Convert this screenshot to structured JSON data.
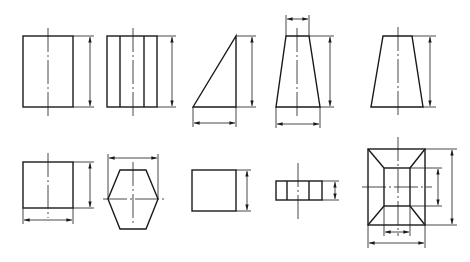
{
  "diagram": {
    "title": "",
    "line_color": "#1a1a1a",
    "background": "#ffffff",
    "figures": [
      {
        "id": 1,
        "name": "rectangle-view",
        "row": 1,
        "dimensions": [
          "height"
        ]
      },
      {
        "id": 2,
        "name": "multi-face-prism-view",
        "row": 1,
        "dimensions": [
          "height"
        ]
      },
      {
        "id": 3,
        "name": "right-triangle-view",
        "row": 1,
        "dimensions": [
          "height",
          "width"
        ]
      },
      {
        "id": 4,
        "name": "trapezoid-view-dimensioned",
        "row": 1,
        "dimensions": [
          "top-width",
          "height",
          "bottom-width"
        ]
      },
      {
        "id": 5,
        "name": "trapezoid-view",
        "row": 1,
        "dimensions": [
          "height"
        ]
      },
      {
        "id": 6,
        "name": "square-view",
        "row": 2,
        "dimensions": [
          "height",
          "width"
        ]
      },
      {
        "id": 7,
        "name": "hexagon-view",
        "row": 2,
        "dimensions": [
          "across-corners-width"
        ]
      },
      {
        "id": 8,
        "name": "plain-rectangle-view",
        "row": 2,
        "dimensions": [
          "height"
        ]
      },
      {
        "id": 9,
        "name": "thin-prism-view",
        "row": 2,
        "dimensions": [
          "height"
        ]
      },
      {
        "id": 10,
        "name": "frustum-top-view",
        "row": 2,
        "dimensions": [
          "outer-height",
          "inner-height",
          "inner-width",
          "outer-width"
        ]
      }
    ]
  }
}
